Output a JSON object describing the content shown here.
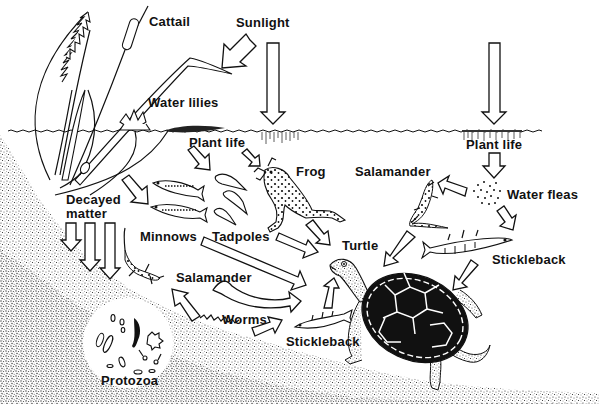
{
  "diagram": {
    "type": "pond food web",
    "labels": {
      "cattail": "Cattail",
      "sunlight": "Sunlight",
      "water_lilies": "Water lilies",
      "plant_life_left": "Plant life",
      "plant_life_right": "Plant life",
      "frog": "Frog",
      "salamander_top": "Salamander",
      "water_fleas": "Water fleas",
      "decayed_matter_line1": "Decayed",
      "decayed_matter_line2": "matter",
      "minnows": "Minnows",
      "tadpoles": "Tadpoles",
      "turtle": "Turtle",
      "stickleback_right": "Stickleback",
      "salamander_bottom": "Salamander",
      "worms": "Worms",
      "stickleback_bottom": "Stickleback",
      "protozoa": "Protozoa"
    },
    "nodes": [
      "Sunlight",
      "Cattail",
      "Water lilies",
      "Plant life",
      "Decayed matter",
      "Protozoa",
      "Minnows",
      "Tadpoles",
      "Frog",
      "Salamander",
      "Worms",
      "Water fleas",
      "Stickleback",
      "Turtle"
    ],
    "edges": [
      {
        "from": "Sunlight",
        "to": "Cattail"
      },
      {
        "from": "Sunlight",
        "to": "Plant life (left)"
      },
      {
        "from": "Sunlight",
        "to": "Plant life (right)"
      },
      {
        "from": "Plant life (left)",
        "to": "Tadpoles"
      },
      {
        "from": "Plant life (left)",
        "to": "Frog"
      },
      {
        "from": "Water lilies",
        "to": "Minnows"
      },
      {
        "from": "Decayed matter",
        "to": "Bottom / Protozoa"
      },
      {
        "from": "Frog",
        "to": "Turtle"
      },
      {
        "from": "Minnows",
        "to": "Turtle"
      },
      {
        "from": "Tadpoles",
        "to": "Turtle"
      },
      {
        "from": "Salamander (bottom)",
        "to": "Turtle"
      },
      {
        "from": "Worms",
        "to": "Salamander (bottom)"
      },
      {
        "from": "Worms",
        "to": "Stickleback (bottom)"
      },
      {
        "from": "Stickleback (bottom)",
        "to": "Turtle"
      },
      {
        "from": "Plant life (right)",
        "to": "Water fleas"
      },
      {
        "from": "Water fleas",
        "to": "Salamander (top)"
      },
      {
        "from": "Water fleas",
        "to": "Stickleback (right)"
      },
      {
        "from": "Salamander (top)",
        "to": "Turtle"
      },
      {
        "from": "Stickleback (right)",
        "to": "Turtle"
      }
    ]
  }
}
